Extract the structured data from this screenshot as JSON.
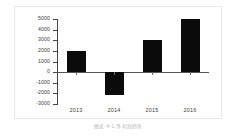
{
  "figure": {
    "caption": "图表 4-1  净利润趋势"
  },
  "chart_data": {
    "type": "bar",
    "title": "",
    "xlabel": "",
    "ylabel": "",
    "categories": [
      "2013",
      "2014",
      "2015",
      "2016"
    ],
    "values": [
      2000,
      -2150,
      3000,
      5000
    ],
    "ylim": [
      -3000,
      5000
    ],
    "yticks": [
      5000,
      4000,
      3000,
      2000,
      1000,
      0,
      -1000,
      -2000,
      -3000
    ],
    "ytick_labels": [
      "5000",
      "4000",
      "3000",
      "2000",
      "1000",
      "0",
      "-1000",
      "-2000",
      "-3000"
    ],
    "grid": false,
    "legend": null,
    "bar_color": "#0b0b0b",
    "axis_color": "#444444",
    "background": "#ffffff"
  }
}
